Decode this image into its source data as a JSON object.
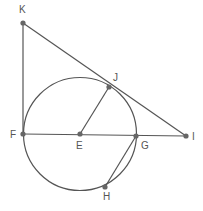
{
  "diagram": {
    "type": "geometry",
    "colors": {
      "stroke": "#555555",
      "point": "#666666",
      "label": "#555555",
      "background": "#ffffff"
    },
    "circle": {
      "center": "E",
      "cx": 80,
      "cy": 134,
      "r": 56.5
    },
    "points": [
      {
        "id": "K",
        "label": "K",
        "x": 23,
        "y": 23,
        "lx": 19,
        "ly": 13
      },
      {
        "id": "J",
        "label": "J",
        "x": 109,
        "y": 87,
        "lx": 113,
        "ly": 81
      },
      {
        "id": "F",
        "label": "F",
        "x": 23,
        "y": 134,
        "lx": 10,
        "ly": 138
      },
      {
        "id": "E",
        "label": "E",
        "x": 80,
        "y": 134,
        "lx": 76,
        "ly": 149
      },
      {
        "id": "G",
        "label": "G",
        "x": 136,
        "y": 136,
        "lx": 141,
        "ly": 149
      },
      {
        "id": "I",
        "label": "I",
        "x": 186,
        "y": 136,
        "lx": 192,
        "ly": 140
      },
      {
        "id": "H",
        "label": "H",
        "x": 105,
        "y": 187,
        "lx": 103,
        "ly": 200
      }
    ],
    "segments": [
      {
        "from": "K",
        "to": "F"
      },
      {
        "from": "K",
        "to": "I"
      },
      {
        "from": "F",
        "to": "I"
      },
      {
        "from": "E",
        "to": "J"
      },
      {
        "from": "G",
        "to": "H"
      }
    ]
  }
}
